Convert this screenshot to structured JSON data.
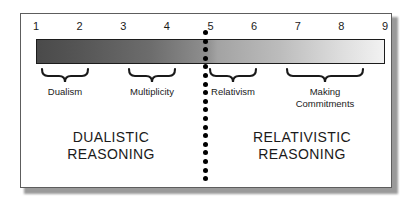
{
  "chart_data": {
    "type": "diagram",
    "scale": {
      "ticks": [
        "1",
        "2",
        "3",
        "4",
        "5",
        "6",
        "7",
        "8",
        "9"
      ],
      "min": 1,
      "max": 9,
      "gradient_from": "#4a4a4a",
      "gradient_to": "#f2f2f2",
      "gradient_description": "dark gray at position 1 fading to near white at position 9"
    },
    "divider": {
      "at_position": 5,
      "style": "vertical dotted line",
      "color": "#000000"
    },
    "stages": [
      {
        "label": "Dualism",
        "from": 1,
        "to": 2
      },
      {
        "label": "Multiplicity",
        "from": 3,
        "to": 4
      },
      {
        "label": "Relativism",
        "from": 5,
        "to": 6
      },
      {
        "label": "Making\nCommitments",
        "from": 7,
        "to": 9
      }
    ],
    "regions": [
      {
        "label": "DUALISTIC\nREASONING",
        "from": 1,
        "to": 5
      },
      {
        "label": "RELATIVISTIC\nREASONING",
        "from": 5,
        "to": 9
      }
    ]
  },
  "scale": {
    "ticks": [
      {
        "value": "1"
      },
      {
        "value": "2"
      },
      {
        "value": "3"
      },
      {
        "value": "4"
      },
      {
        "value": "5"
      },
      {
        "value": "6"
      },
      {
        "value": "7"
      },
      {
        "value": "8"
      },
      {
        "value": "9"
      }
    ]
  },
  "stages": {
    "dualism": "Dualism",
    "multiplicity": "Multiplicity",
    "relativism": "Relativism",
    "making_commitments": "Making\nCommitments"
  },
  "regions": {
    "left": "DUALISTIC\nREASONING",
    "right": "RELATIVISTIC\nREASONING"
  },
  "colors": {
    "frame": "#5d5d5d",
    "bar_border": "#1c1c1c",
    "gradient_start": "#4a4a4a",
    "gradient_end": "#f2f2f2",
    "divider": "#000000",
    "text": "#1a1a1a"
  }
}
